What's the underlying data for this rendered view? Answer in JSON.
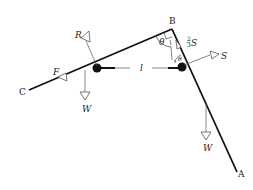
{
  "diagram": {
    "type": "free-body diagram",
    "points": {
      "B": {
        "label": "B",
        "x": 172,
        "y": 29
      },
      "C": {
        "label": "C",
        "x": 29,
        "y": 90
      },
      "A": {
        "label": "A",
        "x": 237,
        "y": 172
      }
    },
    "rods": [
      {
        "name": "rod-BC",
        "from": "B",
        "to": "C"
      },
      {
        "name": "rod-BA",
        "from": "B",
        "to": "A"
      }
    ],
    "masses": [
      {
        "name": "left-mass",
        "x": 97,
        "y": 68
      },
      {
        "name": "right-mass",
        "x": 182,
        "y": 67
      }
    ],
    "forces": {
      "R": {
        "label": "R"
      },
      "F": {
        "label": "F"
      },
      "W_left": {
        "label": "W"
      },
      "W_right": {
        "label": "W"
      },
      "S": {
        "label": "S"
      },
      "S_frac": {
        "label": "S",
        "coefficient_num": "2",
        "coefficient_den": "3"
      }
    },
    "length_label": "l",
    "angle_label": "θ",
    "colors": {
      "line": "#111111",
      "arrow": "#555555",
      "text": "#222222"
    }
  }
}
